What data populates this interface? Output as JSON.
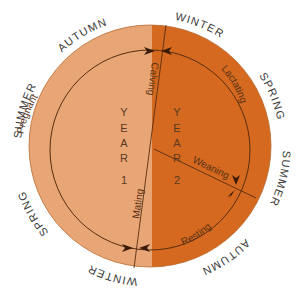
{
  "diagram": {
    "colors": {
      "year1_fill": "#E8A575",
      "year2_fill": "#D4691F",
      "line": "#5a2e10",
      "season_text": "#3a3a3a"
    },
    "outer_seasons_top": [
      "AUTUMN",
      "WINTER"
    ],
    "seasons": {
      "top_left_1": "SUMMER",
      "top_left_2": "AUTUMN",
      "top_right_1": "WINTER",
      "top_right_2": "SPRING",
      "bottom_right_1": "SUMMER",
      "bottom_right_2": "AUTUMN",
      "bottom_left_1": "WINTER",
      "bottom_left_2": "SPRING"
    },
    "phases": {
      "pregnant": "Pregnant",
      "calving": "Calving",
      "lactating": "Lactating",
      "weaning": "Weaning",
      "resting": "Resting",
      "mating": "Mating"
    },
    "years": {
      "year1": {
        "letters": [
          "Y",
          "E",
          "A",
          "R"
        ],
        "number": "1"
      },
      "year2": {
        "letters": [
          "Y",
          "E",
          "A",
          "R"
        ],
        "number": "2"
      }
    }
  }
}
